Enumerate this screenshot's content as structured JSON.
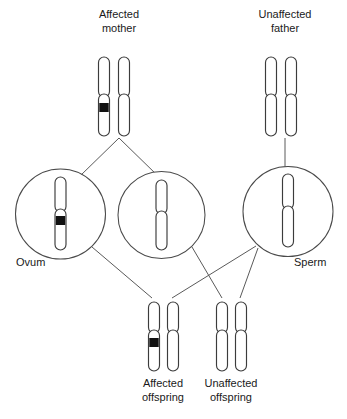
{
  "diagram": {
    "colors": {
      "background": "#ffffff",
      "chromosome_outline": "#3c3c3c",
      "chromosome_fill": "#ffffff",
      "mutation_band": "#111111",
      "gamete_outline": "#4a4a4a",
      "connector_line": "#5a5a5a",
      "label_text": "#1a1a1a"
    },
    "labels": {
      "affected_mother_line1": "Affected",
      "affected_mother_line2": "mother",
      "unaffected_father_line1": "Unaffected",
      "unaffected_father_line2": "father",
      "ovum": "Ovum",
      "sperm": "Sperm",
      "affected_offspring_line1": "Affected",
      "affected_offspring_line2": "offspring",
      "unaffected_offspring_line1": "Unaffected",
      "unaffected_offspring_line2": "offspring"
    },
    "parents": [
      {
        "id": "affected-mother",
        "role": "mother",
        "status": "affected",
        "chromosomes": [
          {
            "id": "mother-chromosome-1",
            "carries_mutation": true
          },
          {
            "id": "mother-chromosome-2",
            "carries_mutation": false
          }
        ]
      },
      {
        "id": "unaffected-father",
        "role": "father",
        "status": "unaffected",
        "chromosomes": [
          {
            "id": "father-chromosome-1",
            "carries_mutation": false
          },
          {
            "id": "father-chromosome-2",
            "carries_mutation": false
          }
        ]
      }
    ],
    "gametes": [
      {
        "id": "ovum-affected",
        "type": "ovum",
        "carries_mutation": true,
        "labelled": true
      },
      {
        "id": "ovum-unaffected",
        "type": "ovum",
        "carries_mutation": false,
        "labelled": false
      },
      {
        "id": "sperm",
        "type": "sperm",
        "carries_mutation": false,
        "labelled": true
      }
    ],
    "offspring": [
      {
        "id": "affected-offspring",
        "status": "affected",
        "chromosomes": [
          {
            "id": "affected-offspring-chromosome-1",
            "carries_mutation": true
          },
          {
            "id": "affected-offspring-chromosome-2",
            "carries_mutation": false
          }
        ]
      },
      {
        "id": "unaffected-offspring",
        "status": "unaffected",
        "chromosomes": [
          {
            "id": "unaffected-offspring-chromosome-1",
            "carries_mutation": false
          },
          {
            "id": "unaffected-offspring-chromosome-2",
            "carries_mutation": false
          }
        ]
      }
    ]
  }
}
